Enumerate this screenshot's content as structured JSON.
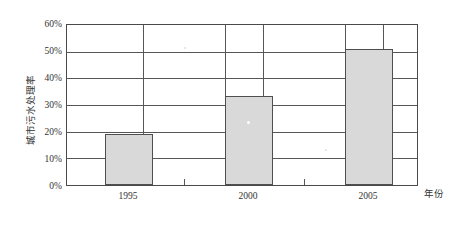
{
  "chart_data": {
    "type": "bar",
    "title": "",
    "subtitle": "",
    "xlabel": "年份",
    "ylabel": "城市污水处理率",
    "categories": [
      "1995",
      "2000",
      "2005"
    ],
    "values": [
      19,
      33.5,
      51
    ],
    "value_labels": [
      "19%",
      "33.5%",
      "51%"
    ],
    "series": [
      {
        "name": "城市污水处理率",
        "values": [
          19,
          33.5,
          51
        ]
      }
    ],
    "ylim": [
      0,
      60
    ],
    "ytick_values": [
      0,
      10,
      20,
      30,
      40,
      50,
      60
    ],
    "ytick_labels": [
      "0%",
      "10%",
      "20%",
      "30%",
      "40%",
      "50%",
      "60%"
    ],
    "xtick_labels": [
      "1995",
      "2000",
      "2005"
    ],
    "grid": true,
    "grid_axis": "y",
    "legend": false,
    "legend_position": "none",
    "annotations": [],
    "colors": {
      "bar_fill": "#d9d9d9",
      "bar_stroke": "#4f4f4f",
      "axis": "#4a4a4a",
      "grid": "#575757",
      "text": "#333333",
      "background": "#ffffff"
    }
  }
}
